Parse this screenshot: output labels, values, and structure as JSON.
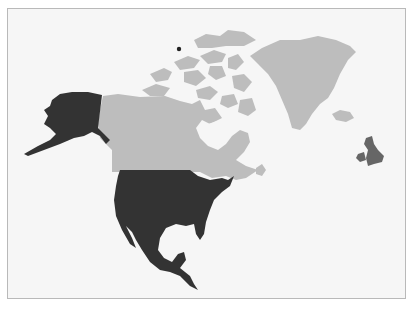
{
  "map": {
    "region": "North America and North Atlantic",
    "colors": {
      "background": "#f6f6f6",
      "frame_border": "#b9b9b9",
      "highlighted": "#333333",
      "other_land": "#bdbdbd",
      "uk": "#666666",
      "marker": "#222222"
    },
    "highlighted_regions": [
      "United States",
      "Alaska",
      "Mexico",
      "Central America"
    ],
    "other_regions": [
      "Canada",
      "Canadian Arctic Archipelago",
      "Greenland",
      "Iceland"
    ],
    "secondary_regions": [
      "United Kingdom",
      "Ireland"
    ],
    "markers": [
      {
        "name": "north-pole-point",
        "x": 179,
        "y": 49
      }
    ]
  }
}
